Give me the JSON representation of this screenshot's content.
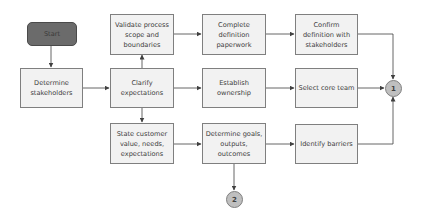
{
  "diagram": {
    "type": "flowchart",
    "colors": {
      "box_fill": "#f2f2f2",
      "box_border": "#7f7f7f",
      "start_fill": "#6b6b6b",
      "connector_fill": "#bfbfbf",
      "line": "#404040"
    },
    "nodes": {
      "start": "Start",
      "determine_stakeholders": "Determine stakeholders",
      "validate_scope": "Validate process scope and boundaries",
      "clarify_expectations": "Clarify expectations",
      "state_customer_value": "State customer value, needs, expectations",
      "complete_paperwork": "Complete definition paperwork",
      "establish_ownership": "Establish ownership",
      "determine_goals": "Determine goals, outputs, outcomes",
      "confirm_definition": "Confirm definition with stakeholders",
      "select_core_team": "Select core team",
      "identify_barriers": "Identify barriers",
      "connector_1": "1",
      "connector_2": "2"
    },
    "edges": [
      [
        "start",
        "determine_stakeholders"
      ],
      [
        "determine_stakeholders",
        "clarify_expectations"
      ],
      [
        "clarify_expectations",
        "validate_scope"
      ],
      [
        "clarify_expectations",
        "state_customer_value"
      ],
      [
        "clarify_expectations",
        "establish_ownership"
      ],
      [
        "validate_scope",
        "complete_paperwork"
      ],
      [
        "complete_paperwork",
        "confirm_definition"
      ],
      [
        "establish_ownership",
        "select_core_team"
      ],
      [
        "state_customer_value",
        "determine_goals"
      ],
      [
        "determine_goals",
        "identify_barriers"
      ],
      [
        "determine_goals",
        "connector_2"
      ],
      [
        "confirm_definition",
        "connector_1"
      ],
      [
        "select_core_team",
        "connector_1"
      ],
      [
        "identify_barriers",
        "connector_1"
      ]
    ]
  }
}
